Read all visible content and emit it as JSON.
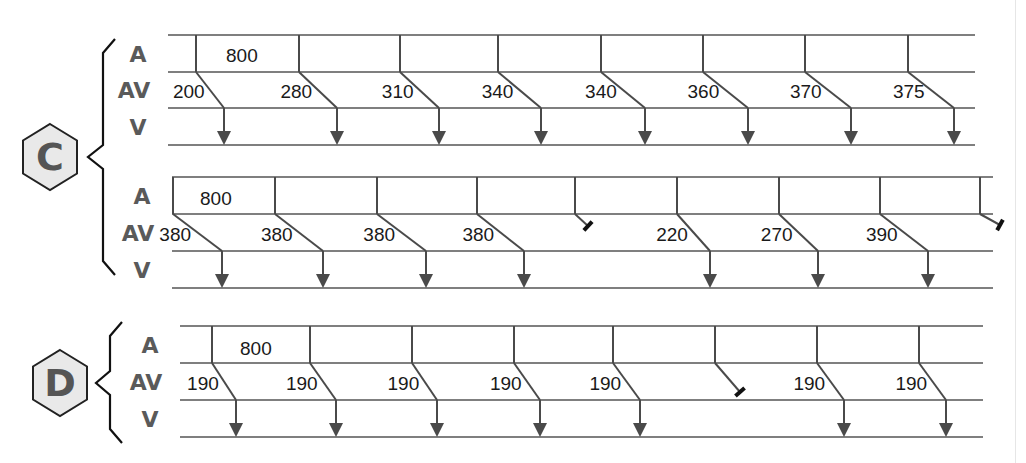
{
  "colors": {
    "line": "#555555",
    "wave": "#4a4a4a",
    "label": "#5a5a5a",
    "block": "#111111",
    "hex_fill": "#e9e9e9",
    "hex_stroke": "#222222",
    "hex_letter": "#555555",
    "bracket": "#111111",
    "text": "#1a1a1a"
  },
  "panels": [
    {
      "id": "C",
      "label": "C",
      "hexagon": {
        "cx": 50,
        "cy": 157,
        "w": 54,
        "h": 66
      },
      "bracket": {
        "x": 103,
        "top": 39,
        "bottom": 275,
        "tip_x": 88,
        "tip_y": 157
      },
      "strips": [
        {
          "lines_y": [
            35,
            72,
            108,
            145
          ],
          "x_start": 168,
          "x_end": 975,
          "row_labels": [
            "A",
            "AV",
            "V"
          ],
          "rr_label": "800",
          "rr_label_pos": [
            226,
            62
          ],
          "beats": [
            {
              "a_x": 196,
              "v_x": 224,
              "av": "200",
              "conducted": true
            },
            {
              "a_x": 299,
              "v_x": 337,
              "av": "280",
              "conducted": true
            },
            {
              "a_x": 400,
              "v_x": 439,
              "av": "310",
              "conducted": true
            },
            {
              "a_x": 498,
              "v_x": 541,
              "av": "340",
              "conducted": true
            },
            {
              "a_x": 601,
              "v_x": 645,
              "av": "340",
              "conducted": true
            },
            {
              "a_x": 703,
              "v_x": 748,
              "av": "360",
              "conducted": true
            },
            {
              "a_x": 805,
              "v_x": 851,
              "av": "370",
              "conducted": true
            },
            {
              "a_x": 908,
              "v_x": 954,
              "av": "375",
              "conducted": true
            }
          ]
        },
        {
          "lines_y": [
            177,
            214,
            251,
            288
          ],
          "x_start": 172,
          "x_end": 993,
          "row_labels": [
            "A",
            "AV",
            "V"
          ],
          "rr_label": "800",
          "rr_label_pos": [
            200,
            205
          ],
          "left_edge_x": 173,
          "beats": [
            {
              "a_x": 173,
              "v_x": 222,
              "av": "380",
              "conducted": true
            },
            {
              "a_x": 275,
              "v_x": 323,
              "av": "380",
              "conducted": true
            },
            {
              "a_x": 377,
              "v_x": 426,
              "av": "380",
              "conducted": true
            },
            {
              "a_x": 477,
              "v_x": 524,
              "av": "380",
              "conducted": true
            },
            {
              "a_x": 575,
              "block_x": 588,
              "block_y": 229,
              "av": "",
              "conducted": false
            },
            {
              "a_x": 677,
              "v_x": 710,
              "av": "220",
              "conducted": true
            },
            {
              "a_x": 779,
              "v_x": 818,
              "av": "270",
              "conducted": true
            },
            {
              "a_x": 880,
              "v_x": 928,
              "av": "390",
              "conducted": true
            },
            {
              "a_x": 980,
              "block_x": 1000,
              "block_y": 228,
              "av": "",
              "conducted": false
            }
          ]
        }
      ]
    },
    {
      "id": "D",
      "label": "D",
      "hexagon": {
        "cx": 60,
        "cy": 383,
        "w": 54,
        "h": 66
      },
      "bracket": {
        "x": 110,
        "top": 322,
        "bottom": 443,
        "tip_x": 96,
        "tip_y": 383
      },
      "strips": [
        {
          "lines_y": [
            326,
            363,
            400,
            437
          ],
          "x_start": 180,
          "x_end": 983,
          "row_labels": [
            "A",
            "AV",
            "V"
          ],
          "rr_label": "800",
          "rr_label_pos": [
            240,
            355
          ],
          "beats": [
            {
              "a_x": 212,
              "v_x": 236,
              "av": "190",
              "conducted": true
            },
            {
              "a_x": 310,
              "v_x": 336,
              "av": "190",
              "conducted": true
            },
            {
              "a_x": 412,
              "v_x": 437,
              "av": "190",
              "conducted": true
            },
            {
              "a_x": 514,
              "v_x": 540,
              "av": "190",
              "conducted": true
            },
            {
              "a_x": 613,
              "v_x": 640,
              "av": "190",
              "conducted": true
            },
            {
              "a_x": 715,
              "block_x": 740,
              "block_y": 395,
              "av": "",
              "conducted": false
            },
            {
              "a_x": 817,
              "v_x": 844,
              "av": "190",
              "conducted": true
            },
            {
              "a_x": 919,
              "v_x": 946,
              "av": "190",
              "conducted": true
            }
          ]
        }
      ]
    }
  ]
}
